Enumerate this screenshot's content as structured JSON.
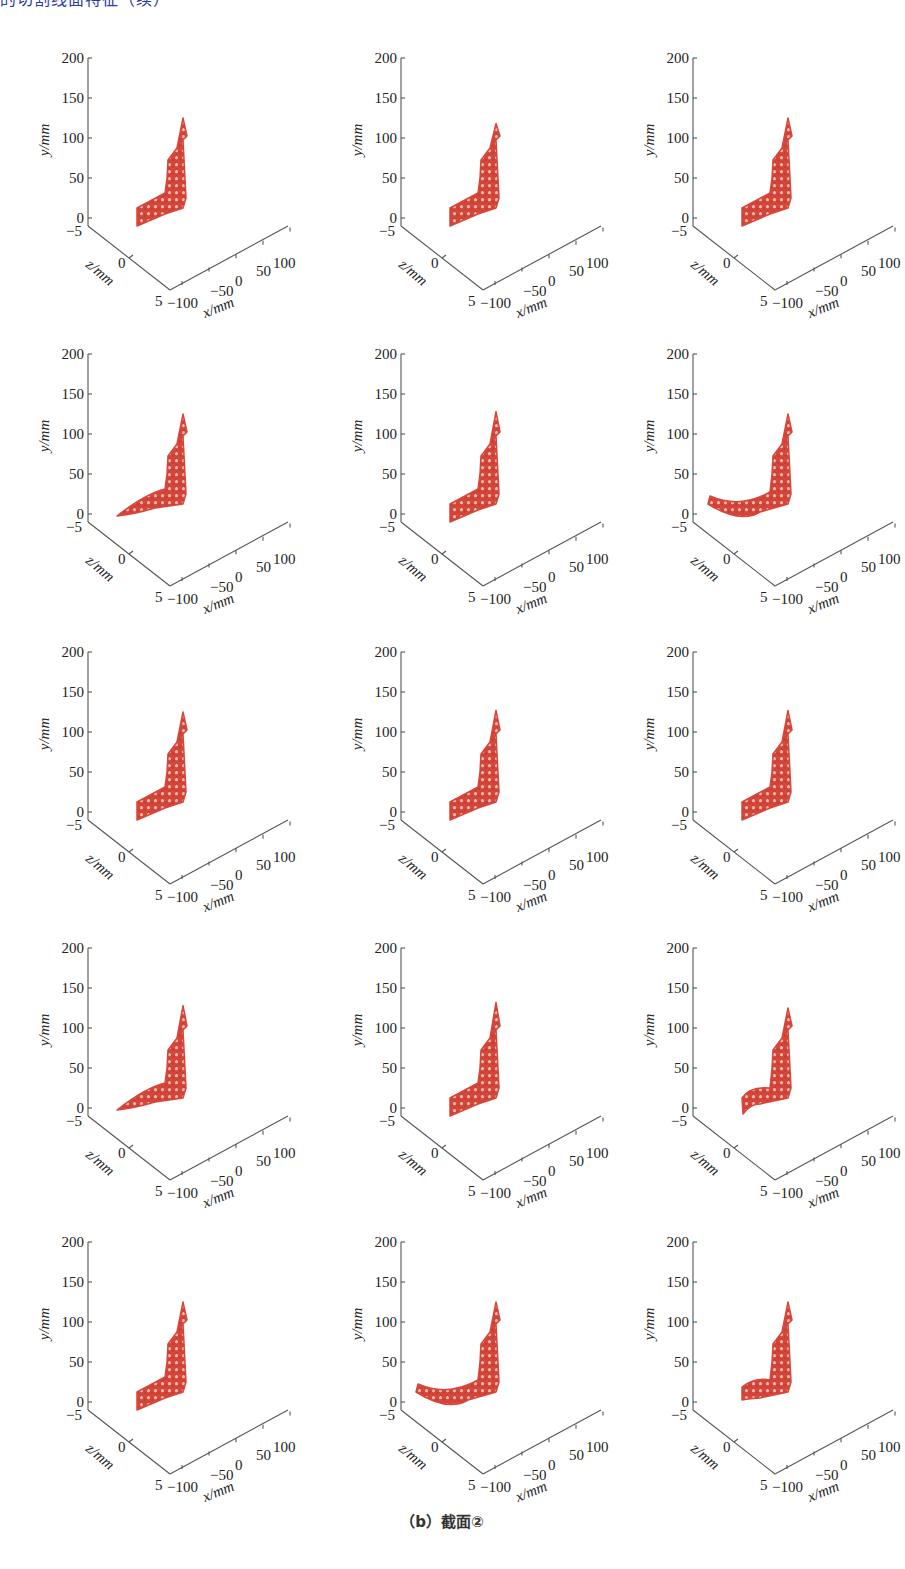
{
  "header": {
    "cut_text": "的切割线面特征（续）"
  },
  "caption": "（b）截面②",
  "axes": {
    "y_label": "y/mm",
    "z_label": "z/mm",
    "x_label": "x/mm",
    "y_ticks": [
      "200",
      "150",
      "100",
      "50",
      "0"
    ],
    "z_ticks": [
      "−5",
      "0",
      "5"
    ],
    "x_ticks": [
      "−100",
      "−50",
      "0",
      "50",
      "100"
    ]
  },
  "colors": {
    "mesh": "#d8463a",
    "mesh_light": "#f3b9ad",
    "axis": "#555555"
  },
  "chart_data": {
    "type": "scatter",
    "layout": {
      "rows": 5,
      "cols": 3
    },
    "xlabel": "x/mm",
    "ylabel": "y/mm",
    "zlabel": "z/mm",
    "xlim": [
      -100,
      100
    ],
    "ylim": [
      -5,
      200
    ],
    "zlim": [
      -5,
      5
    ],
    "x_ticks": [
      -100,
      -50,
      0,
      50,
      100
    ],
    "y_ticks": [
      0,
      50,
      100,
      150,
      200
    ],
    "z_ticks": [
      -5,
      0,
      5
    ],
    "grid": false,
    "panels": [
      {
        "index": 1,
        "tip_height_mm": 125,
        "shoulder_mm": 100,
        "foot": "straight"
      },
      {
        "index": 2,
        "tip_height_mm": 118,
        "shoulder_mm": 100,
        "foot": "straight"
      },
      {
        "index": 3,
        "tip_height_mm": 125,
        "shoulder_mm": 100,
        "foot": "straight"
      },
      {
        "index": 4,
        "tip_height_mm": 125,
        "shoulder_mm": 100,
        "foot": "tapered"
      },
      {
        "index": 5,
        "tip_height_mm": 128,
        "shoulder_mm": 100,
        "foot": "straight"
      },
      {
        "index": 6,
        "tip_height_mm": 125,
        "shoulder_mm": 100,
        "foot": "curved"
      },
      {
        "index": 7,
        "tip_height_mm": 125,
        "shoulder_mm": 100,
        "foot": "straight"
      },
      {
        "index": 8,
        "tip_height_mm": 127,
        "shoulder_mm": 100,
        "foot": "straight"
      },
      {
        "index": 9,
        "tip_height_mm": 127,
        "shoulder_mm": 100,
        "foot": "straight"
      },
      {
        "index": 10,
        "tip_height_mm": 128,
        "shoulder_mm": 100,
        "foot": "tapered"
      },
      {
        "index": 11,
        "tip_height_mm": 132,
        "shoulder_mm": 100,
        "foot": "straight"
      },
      {
        "index": 12,
        "tip_height_mm": 125,
        "shoulder_mm": 100,
        "foot": "hooked"
      },
      {
        "index": 13,
        "tip_height_mm": 125,
        "shoulder_mm": 100,
        "foot": "straight"
      },
      {
        "index": 14,
        "tip_height_mm": 125,
        "shoulder_mm": 100,
        "foot": "curved"
      },
      {
        "index": 15,
        "tip_height_mm": 125,
        "shoulder_mm": 100,
        "foot": "short"
      }
    ]
  }
}
